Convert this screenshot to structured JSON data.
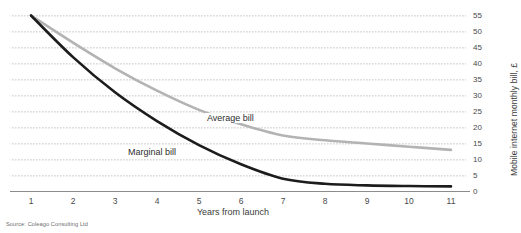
{
  "chart_data": {
    "type": "line",
    "title": "",
    "xlabel": "Years from launch",
    "ylabel": "Mobile internet monthly bill, £",
    "x": [
      1,
      2,
      3,
      4,
      5,
      6,
      7,
      8,
      9,
      10,
      11
    ],
    "xlim": [
      1,
      11
    ],
    "ylim": [
      0,
      55
    ],
    "grid": true,
    "legend_position": "inline-annotations",
    "yaxis_side": "right",
    "ytick_labels": [
      "55",
      "50",
      "45",
      "40",
      "35",
      "30",
      "25",
      "20",
      "15",
      "10",
      "5",
      "0"
    ],
    "ytick_values": [
      55,
      50,
      45,
      40,
      35,
      30,
      25,
      20,
      15,
      10,
      5,
      0
    ],
    "xtick_labels": [
      "1",
      "2",
      "3",
      "4",
      "5",
      "6",
      "7",
      "8",
      "9",
      "10",
      "11"
    ],
    "series": [
      {
        "name": "Average bill",
        "color": "#b3b3b3",
        "values": [
          55,
          46.5,
          38.5,
          31.5,
          25.5,
          21,
          17.5,
          16,
          15,
          14,
          13
        ]
      },
      {
        "name": "Marginal bill",
        "color": "#1c1c1c",
        "values": [
          55,
          42,
          31,
          22,
          14.5,
          8.5,
          4,
          2.4,
          1.9,
          1.7,
          1.6
        ]
      }
    ],
    "annotations": [
      {
        "text": "Average bill",
        "series": "Average bill"
      },
      {
        "text": "Marginal bill",
        "series": "Marginal bill"
      }
    ],
    "source": "Source: Coleago Consulting Ltd"
  },
  "axis": {
    "x_title": "Years from launch",
    "y_title": "Mobile internet monthly bill, £"
  },
  "labels": {
    "average": "Average bill",
    "marginal": "Marginal bill"
  },
  "footer": {
    "source": "Source: Coleago Consulting Ltd"
  },
  "colors": {
    "average_series": "#b3b3b3",
    "marginal_series": "#1c1c1c",
    "gridline": "#bfbfbf",
    "axis": "#8c8c8c",
    "text": "#3b3b3b"
  }
}
